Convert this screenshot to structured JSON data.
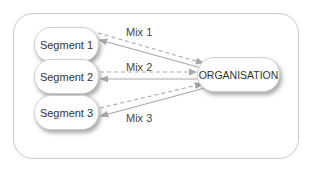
{
  "diagram": {
    "type": "flow",
    "nodes": {
      "segment1": "Segment 1",
      "segment2": "Segment 2",
      "segment3": "Segment 3",
      "organisation": "ORGANISATION"
    },
    "edge_labels": {
      "mix1": "Mix 1",
      "mix2": "Mix 2",
      "mix3": "Mix 3"
    },
    "edges": [
      {
        "from": "Segment 1",
        "to": "ORGANISATION",
        "style": "dashed",
        "label": "Mix 1"
      },
      {
        "from": "ORGANISATION",
        "to": "Segment 1",
        "style": "solid"
      },
      {
        "from": "Segment 2",
        "to": "ORGANISATION",
        "style": "dashed",
        "label": "Mix 2"
      },
      {
        "from": "ORGANISATION",
        "to": "Segment 2",
        "style": "solid"
      },
      {
        "from": "Segment 3",
        "to": "ORGANISATION",
        "style": "dashed",
        "label": "Mix 3"
      },
      {
        "from": "ORGANISATION",
        "to": "Segment 3",
        "style": "solid"
      }
    ],
    "colors": {
      "frame_border": "#c8c8c8",
      "dashed_line": "#b0b0b0",
      "solid_line": "#a8a8a8",
      "text": "#333333"
    }
  }
}
